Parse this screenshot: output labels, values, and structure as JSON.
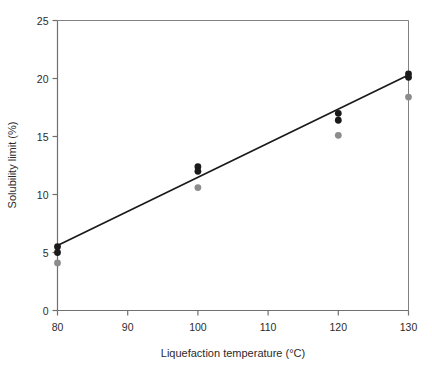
{
  "chart_data": {
    "type": "scatter",
    "title": "",
    "xlabel": "Liquefaction temperature (°C)",
    "ylabel": "Solubility limit (%)",
    "xlim": [
      80,
      130
    ],
    "ylim": [
      0,
      25
    ],
    "xticks": [
      80,
      90,
      100,
      110,
      120,
      130
    ],
    "yticks": [
      0,
      5,
      10,
      15,
      20,
      25
    ],
    "xtick_labels": [
      "80",
      "90",
      "100",
      "110",
      "120",
      "130"
    ],
    "ytick_labels": [
      "0",
      "5",
      "10",
      "15",
      "20",
      "25"
    ],
    "grid": false,
    "legend": "none",
    "series": [
      {
        "name": "black-markers",
        "color": "#1a1a1a",
        "marker": "circle",
        "points": [
          {
            "x": 80,
            "y": 5.5
          },
          {
            "x": 80,
            "y": 5.0
          },
          {
            "x": 100,
            "y": 12.4
          },
          {
            "x": 100,
            "y": 12.0
          },
          {
            "x": 120,
            "y": 17.0
          },
          {
            "x": 120,
            "y": 16.4
          },
          {
            "x": 130,
            "y": 20.4
          },
          {
            "x": 130,
            "y": 20.1
          }
        ]
      },
      {
        "name": "grey-markers",
        "color": "#8c8c8c",
        "marker": "circle",
        "points": [
          {
            "x": 80,
            "y": 4.1
          },
          {
            "x": 100,
            "y": 10.6
          },
          {
            "x": 120,
            "y": 15.1
          },
          {
            "x": 130,
            "y": 18.4
          }
        ]
      }
    ],
    "fit_line": {
      "name": "regression-line",
      "color": "#1a1a1a",
      "x_start": 80,
      "y_start": 5.6,
      "x_end": 130,
      "y_end": 20.3
    },
    "frame_color": "#808080",
    "axis_color": "#707070"
  }
}
